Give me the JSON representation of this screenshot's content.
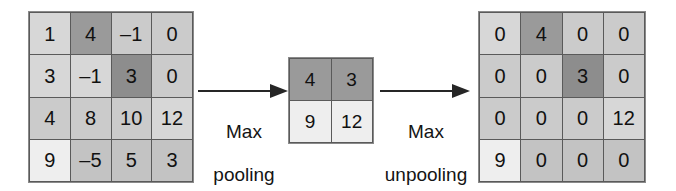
{
  "diagram": {
    "matrices": [
      {
        "name": "input-feature-map",
        "rows": 4,
        "cols": 4,
        "cells": [
          {
            "value": "1",
            "tone": "tone-light"
          },
          {
            "value": "4",
            "tone": "tone-dark"
          },
          {
            "value": "–1",
            "tone": "tone-mid"
          },
          {
            "value": "0",
            "tone": "tone-mid"
          },
          {
            "value": "3",
            "tone": "tone-light"
          },
          {
            "value": "–1",
            "tone": "tone-light"
          },
          {
            "value": "3",
            "tone": "tone-darker"
          },
          {
            "value": "0",
            "tone": "tone-mid"
          },
          {
            "value": "4",
            "tone": "tone-mid"
          },
          {
            "value": "8",
            "tone": "tone-mid"
          },
          {
            "value": "10",
            "tone": "tone-mid"
          },
          {
            "value": "12",
            "tone": "tone-light"
          },
          {
            "value": "9",
            "tone": "tone-white"
          },
          {
            "value": "–5",
            "tone": "tone-mid2"
          },
          {
            "value": "5",
            "tone": "tone-mid2"
          },
          {
            "value": "3",
            "tone": "tone-mid2"
          }
        ]
      },
      {
        "name": "pooled-feature-map",
        "rows": 2,
        "cols": 2,
        "cells": [
          {
            "value": "4",
            "tone": "tone-dark"
          },
          {
            "value": "3",
            "tone": "tone-dark"
          },
          {
            "value": "9",
            "tone": "tone-white"
          },
          {
            "value": "12",
            "tone": "tone-white"
          }
        ]
      },
      {
        "name": "unpooled-feature-map",
        "rows": 4,
        "cols": 4,
        "cells": [
          {
            "value": "0",
            "tone": "tone-light"
          },
          {
            "value": "4",
            "tone": "tone-dark"
          },
          {
            "value": "0",
            "tone": "tone-mid"
          },
          {
            "value": "0",
            "tone": "tone-mid"
          },
          {
            "value": "0",
            "tone": "tone-mid"
          },
          {
            "value": "0",
            "tone": "tone-mid"
          },
          {
            "value": "3",
            "tone": "tone-darker"
          },
          {
            "value": "0",
            "tone": "tone-mid"
          },
          {
            "value": "0",
            "tone": "tone-mid"
          },
          {
            "value": "0",
            "tone": "tone-mid"
          },
          {
            "value": "0",
            "tone": "tone-mid"
          },
          {
            "value": "12",
            "tone": "tone-light"
          },
          {
            "value": "9",
            "tone": "tone-white"
          },
          {
            "value": "0",
            "tone": "tone-mid2"
          },
          {
            "value": "0",
            "tone": "tone-mid2"
          },
          {
            "value": "0",
            "tone": "tone-mid2"
          }
        ]
      }
    ],
    "arrows": [
      {
        "name": "max-pooling",
        "label_line1": "Max",
        "label_line2": "pooling"
      },
      {
        "name": "max-unpooling",
        "label_line1": "Max",
        "label_line2": "unpooling"
      }
    ]
  },
  "chart_data": {
    "type": "heatmap",
    "xlabel": "",
    "ylabel": "",
    "panels": [
      {
        "name": "input",
        "shape": [
          4,
          4
        ],
        "values": [
          [
            1,
            4,
            -1,
            0
          ],
          [
            3,
            -1,
            3,
            0
          ],
          [
            4,
            8,
            10,
            12
          ],
          [
            9,
            -5,
            5,
            3
          ]
        ]
      },
      {
        "name": "after-max-pooling",
        "shape": [
          2,
          2
        ],
        "values": [
          [
            4,
            3
          ],
          [
            9,
            12
          ]
        ]
      },
      {
        "name": "after-max-unpooling",
        "shape": [
          4,
          4
        ],
        "values": [
          [
            0,
            4,
            0,
            0
          ],
          [
            0,
            0,
            3,
            0
          ],
          [
            0,
            0,
            0,
            12
          ],
          [
            9,
            0,
            0,
            0
          ]
        ]
      }
    ],
    "annotations": [
      "Max pooling",
      "Max unpooling"
    ],
    "grid": true,
    "legend": "none"
  }
}
